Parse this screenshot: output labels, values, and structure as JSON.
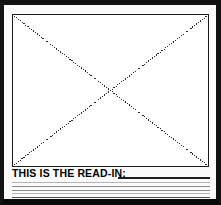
{
  "page": {
    "width": 221,
    "height": 205,
    "background_color": "#ffffff",
    "frame_color": "#111111"
  },
  "image_placeholder": {
    "name": "image-placeholder",
    "description": "empty framed box crossed by two dotted diagonals forming an X",
    "fill_color": "#ffffff",
    "border_color": "#1a1a1a",
    "diagonal_style": "dotted",
    "diagonal_color": "#2b2b2b"
  },
  "readin": {
    "label": "THIS IS THE READ-IN:",
    "label_color": "#000000",
    "rule_color": "#8c8c8c",
    "lead_rule_color": "#1d1d1d",
    "rule_count": 6,
    "rules": [
      {
        "weight": "lead",
        "y": 9
      },
      {
        "weight": "faint",
        "y": 14
      },
      {
        "weight": "normal",
        "y": 18
      },
      {
        "weight": "normal",
        "y": 22
      },
      {
        "weight": "faint",
        "y": 25
      },
      {
        "weight": "strong",
        "y": 29
      }
    ]
  }
}
